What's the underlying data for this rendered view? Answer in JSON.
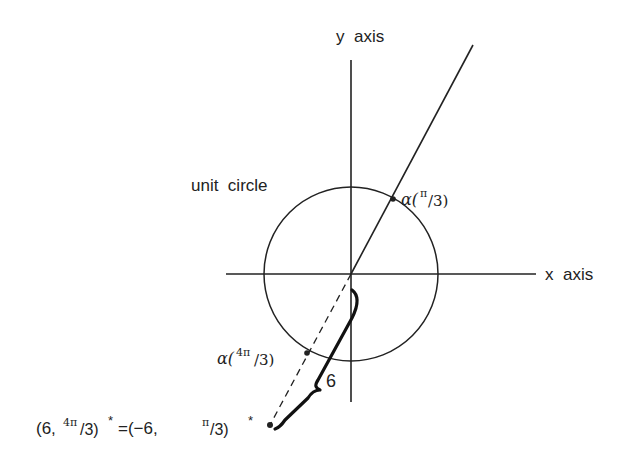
{
  "labels": {
    "y_axis": "y  axis",
    "x_axis": "x  axis",
    "unit_circle": "unit  circle",
    "alpha_pi3": "α(",
    "pi3_num": "π",
    "pi3_den": "/3)",
    "alpha_4pi3": "α(",
    "four_pi3_num": "4π",
    "four_pi3_den": "/3)",
    "six": "6",
    "eq_part1": "(6,",
    "eq_sup1": "4π",
    "eq_part2": "/3)",
    "eq_star1": "*",
    "eq_part3": "=(−6,  ",
    "eq_sup2": "π",
    "eq_part4": "/3)",
    "eq_star2": "*"
  },
  "geometry": {
    "origin": [
      351,
      274
    ],
    "unit_circle_radius": 87
  },
  "colors": {
    "stroke": "#222222",
    "background": "#ffffff"
  }
}
